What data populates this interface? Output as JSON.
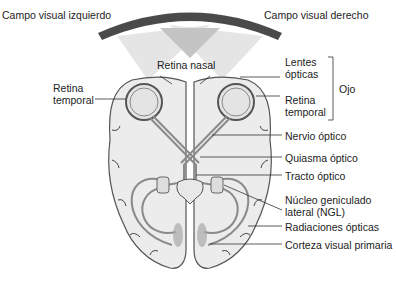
{
  "figure": {
    "colors": {
      "field_arc": "#4a4a4a",
      "field_light": "#e2e2e2",
      "field_dark": "#c4c4c4",
      "brain_fill": "#ececec",
      "brain_stroke": "#555555",
      "pathway": "#8a8a8a",
      "leader": "#333333"
    }
  },
  "labels": {
    "left_field": "Campo visual izquierdo",
    "right_field": "Campo visual derecho",
    "nasal_retina": "Retina nasal",
    "temporal_retina_left_1": "Retina",
    "temporal_retina_left_2": "temporal",
    "lens_1": "Lentes",
    "lens_2": "ópticas",
    "temporal_retina_right_1": "Retina",
    "temporal_retina_right_2": "temporal",
    "eye_group": "Ojo",
    "optic_nerve": "Nervio óptico",
    "optic_chiasm": "Quiasma óptico",
    "optic_tract": "Tracto óptico",
    "lgn_1": "Núcleo geniculado",
    "lgn_2": "lateral (NGL)",
    "optic_radiations": "Radiaciones ópticas",
    "primary_visual_cortex": "Corteza visual primaria"
  }
}
